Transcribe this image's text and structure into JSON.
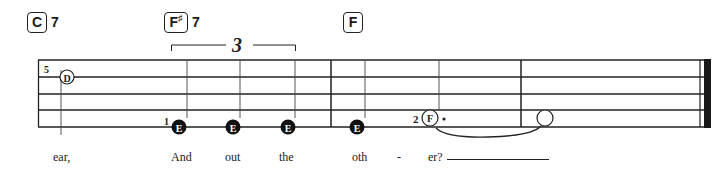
{
  "chords": [
    {
      "root": "C",
      "accidental": "",
      "suffix": "7",
      "x": 27
    },
    {
      "root": "F",
      "accidental": "♯",
      "suffix": "7",
      "x": 164
    },
    {
      "root": "F",
      "accidental": "",
      "suffix": "",
      "x": 343
    }
  ],
  "tuplet": {
    "label": "3",
    "x1": 171,
    "x2": 295
  },
  "staff": {
    "lines_y": [
      60,
      77,
      94,
      110,
      127
    ],
    "x_start": 38,
    "x_end": 706,
    "barlines_x": [
      331,
      521
    ],
    "final_bar": {
      "thin_x": 701,
      "thick_x": 704,
      "thick_w": 7
    }
  },
  "notes": [
    {
      "letter": "D",
      "x": 66,
      "y": 77,
      "filled": false,
      "finger": "5",
      "stem_x": 61
    },
    {
      "letter": "E",
      "x": 178,
      "y": 127,
      "filled": true,
      "finger": "1",
      "stem_x": 187
    },
    {
      "letter": "E",
      "x": 233,
      "y": 127,
      "filled": true,
      "finger": "",
      "stem_x": 241
    },
    {
      "letter": "E",
      "x": 288,
      "y": 127,
      "filled": true,
      "finger": "",
      "stem_x": 296
    },
    {
      "letter": "E",
      "x": 357,
      "y": 127,
      "filled": true,
      "finger": "",
      "stem_x": 365
    },
    {
      "letter": "F",
      "x": 430,
      "y": 118,
      "filled": false,
      "finger": "2",
      "dotted": true,
      "stem_x": 439
    },
    {
      "letter": "",
      "x": 545,
      "y": 118,
      "filled": false,
      "finger": "",
      "stem_x": null
    }
  ],
  "tie": {
    "from_x": 436,
    "to_x": 540,
    "y": 128
  },
  "lyrics": [
    {
      "text": "ear,",
      "x": 53
    },
    {
      "text": "And",
      "x": 171
    },
    {
      "text": "out",
      "x": 225
    },
    {
      "text": "the",
      "x": 279
    },
    {
      "text": "oth",
      "x": 352
    },
    {
      "text": "-",
      "x": 397
    },
    {
      "text": "er?",
      "x": 428
    }
  ],
  "extender": {
    "x1": 447,
    "x2": 549,
    "y": 160
  }
}
